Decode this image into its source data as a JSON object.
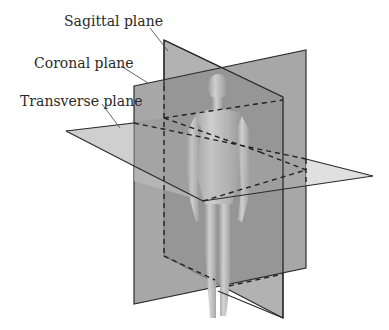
{
  "labels": {
    "sagittal": "Sagittal plane",
    "coronal": "Coronal plane",
    "transverse": "Transverse plane"
  },
  "colors": {
    "background": "#ffffff",
    "sagittal_fill": "#9a9a9a",
    "coronal_fill": "#8c8c8c",
    "transverse_fill": "#c8c8c8",
    "edge": "#2b2b2b",
    "figure": "#c4c4c4",
    "text": "#2a2a2a"
  }
}
